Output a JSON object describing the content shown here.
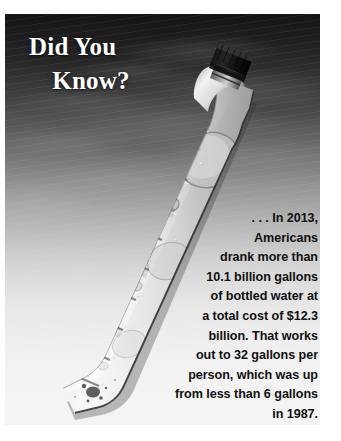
{
  "heading": {
    "line1": "Did You",
    "line2": "Know?"
  },
  "body": {
    "lines": [
      ". . . In 2013,",
      "Americans",
      "drank more than",
      "10.1 billion gallons",
      "of bottled water at",
      "a total cost of $12.3",
      "billion. That works",
      "out to 32 gallons per",
      "person, which was up",
      "from less than 6 gallons",
      "in 1987."
    ],
    "full_text": ". . . In 2013, Americans drank more than 10.1 billion gallons of bottled water at a total cost of $12.3 billion. That works out to 32 gallons per person, which was up from less than 6 gallons in 1987."
  },
  "facts": {
    "year": "2013",
    "volume": "10.1 billion gallons",
    "cost": "$12.3 billion",
    "per_person": "32 gallons",
    "baseline_year": "1987",
    "baseline_per_person": "less than 6 gallons"
  },
  "image": {
    "subject": "plastic-water-bottle",
    "description": "Condensation-covered clear plastic water bottle lying diagonally against a frosted surface"
  },
  "colors": {
    "heading_text": "#ffffff",
    "body_text": "#101010",
    "background_top": "#141414",
    "background_bottom": "#f4f4f4",
    "page": "#ffffff"
  }
}
